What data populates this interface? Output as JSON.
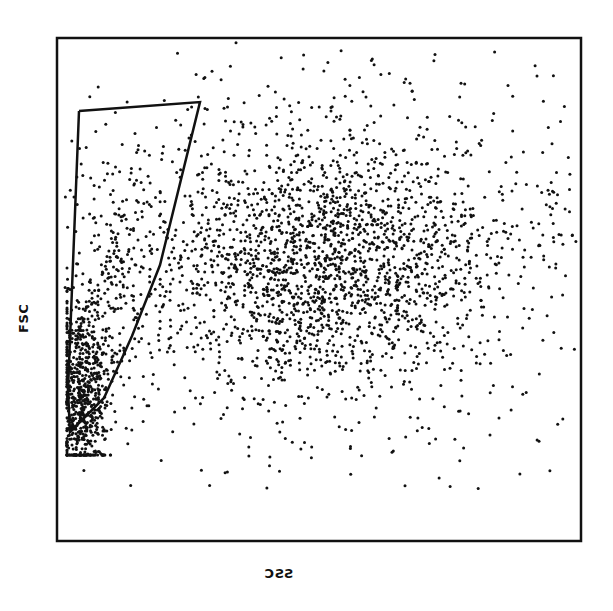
{
  "chart_data": {
    "type": "scatter",
    "title": "",
    "xlabel": "SSC",
    "ylabel": "FSC",
    "xlabel_rendered": "ƎSC",
    "grid": false,
    "legend": null,
    "ticks": {
      "x": [],
      "y": []
    },
    "frame": {
      "x0": 57,
      "y0": 38,
      "x1": 581,
      "y1": 541
    },
    "populations": [
      {
        "name": "gated-low-ssc-population",
        "description": "dense cluster at low SSC / low FSC inside gate",
        "center_px": [
          82,
          390
        ],
        "spread_px": [
          14,
          48
        ],
        "count": 700
      },
      {
        "name": "gated-upper-tail",
        "description": "sparse events extending upward inside gate",
        "center_px": [
          115,
          280
        ],
        "spread_px": [
          20,
          70
        ],
        "count": 220
      },
      {
        "name": "main-population",
        "description": "large diffuse cluster at mid SSC / mid-high FSC",
        "center_px": [
          320,
          262
        ],
        "spread_px": [
          85,
          65
        ],
        "count": 1900
      },
      {
        "name": "background-scatter",
        "description": "sparse events across the plot",
        "center_px": [
          360,
          250
        ],
        "spread_px": [
          170,
          150
        ],
        "count": 650
      }
    ],
    "gate": {
      "name": "polygon-gate",
      "points_px": [
        [
          79,
          111
        ],
        [
          200,
          102
        ],
        [
          160,
          265
        ],
        [
          132,
          336
        ],
        [
          104,
          398
        ],
        [
          70,
          432
        ],
        [
          68,
          390
        ],
        [
          79,
          111
        ]
      ]
    },
    "colors": {
      "points": "#111111",
      "frame": "#111111",
      "background": "#ffffff"
    }
  }
}
